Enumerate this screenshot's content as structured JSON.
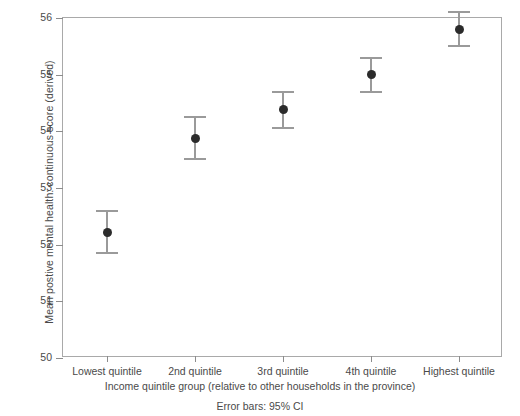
{
  "chart_data": {
    "type": "scatter",
    "title": "",
    "xlabel": "Income quintile group (relative to other households in the province)",
    "ylabel": "Mean postive mental health: continuous score (derived)",
    "caption": "Error bars: 95% CI",
    "categories": [
      "Lowest quintile",
      "2nd quintile",
      "3rd quintile",
      "4th quintile",
      "Highest quintile"
    ],
    "values": [
      52.22,
      53.88,
      54.38,
      55.0,
      55.8
    ],
    "ci_lower": [
      51.85,
      53.51,
      54.06,
      54.7,
      55.5
    ],
    "ci_upper": [
      52.6,
      54.25,
      54.7,
      55.3,
      56.1
    ],
    "ylim": [
      50,
      56
    ],
    "yticks": [
      50,
      51,
      52,
      53,
      54,
      55,
      56
    ],
    "ytick_labels": [
      "50",
      "51",
      "52",
      "53",
      "54",
      "55",
      "56"
    ],
    "grid": false,
    "legend": "none",
    "error_bar_type": "95% CI",
    "marker": "filled-circle",
    "marker_color": "#2b2b2b",
    "errorbar_color": "#9a9a9a",
    "frame_color": "#a9a9a9"
  }
}
